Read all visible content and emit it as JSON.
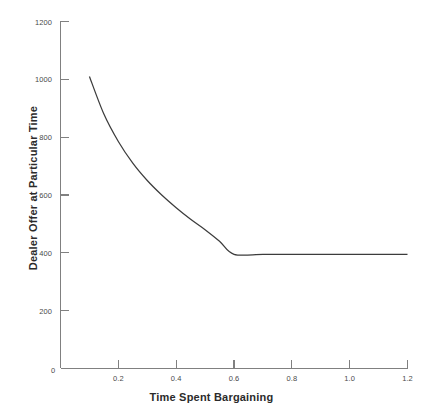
{
  "chart_data": {
    "type": "line",
    "title": "",
    "xlabel": "Time Spent Bargaining",
    "ylabel": "Dealer Offer at Particular Time",
    "xlim": [
      0,
      1.2
    ],
    "ylim": [
      0,
      1200
    ],
    "grid": false,
    "legend": null,
    "x_ticks": [
      0.2,
      0.4,
      0.6,
      0.8,
      1.0,
      1.2
    ],
    "x_tick_labels": [
      "0.2",
      "0.4",
      "0.6",
      "0.8",
      "1.0",
      "1.2"
    ],
    "y_ticks": [
      200,
      400,
      600,
      800,
      1000,
      1200
    ],
    "y_tick_labels": [
      "200",
      "400",
      "600",
      "800",
      "1000",
      "1200"
    ],
    "origin_label": "0",
    "series": [
      {
        "name": "Dealer Offer",
        "color": "#3c3c3c",
        "x": [
          0.1,
          0.15,
          0.2,
          0.25,
          0.3,
          0.35,
          0.4,
          0.45,
          0.5,
          0.55,
          0.6,
          0.7,
          0.8,
          0.9,
          1.0,
          1.1,
          1.2
        ],
        "y": [
          1010,
          880,
          785,
          710,
          650,
          600,
          556,
          516,
          480,
          440,
          395,
          395,
          395,
          395,
          395,
          395,
          395
        ]
      }
    ],
    "annotations": [
      {
        "text": "kink at x = 0.6 where offer levels off",
        "x": 0.6,
        "y": 395
      }
    ]
  },
  "axes": {
    "x_title": "Time Spent Bargaining",
    "y_title": "Dealer Offer at Particular Time",
    "origin": "0"
  }
}
